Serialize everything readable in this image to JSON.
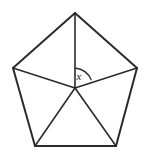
{
  "figure": {
    "kind": "regular-pentagon-with-center-spokes",
    "background_color": "#ffffff",
    "stroke_color": "#2b2b2b",
    "edge_stroke_width": 2,
    "spoke_stroke_width": 1.6,
    "arc_stroke_width": 1.3,
    "canvas": {
      "width": 149,
      "height": 156
    },
    "center": {
      "x": 75,
      "y": 88
    },
    "vertices": [
      {
        "name": "apex",
        "x": 75,
        "y": 13
      },
      {
        "name": "upper-right",
        "x": 137,
        "y": 68
      },
      {
        "name": "lower-right",
        "x": 116,
        "y": 146
      },
      {
        "name": "lower-left",
        "x": 35,
        "y": 146
      },
      {
        "name": "upper-left",
        "x": 13,
        "y": 68
      }
    ],
    "edges": [
      {
        "name": "edge-apex-to-upper-right",
        "from": "apex",
        "to": "upper-right"
      },
      {
        "name": "edge-upper-right-to-lower-right",
        "from": "upper-right",
        "to": "lower-right"
      },
      {
        "name": "edge-lower-right-to-lower-left",
        "from": "lower-right",
        "to": "lower-left"
      },
      {
        "name": "edge-lower-left-to-upper-left",
        "from": "lower-left",
        "to": "upper-left"
      },
      {
        "name": "edge-upper-left-to-apex",
        "from": "upper-left",
        "to": "apex"
      }
    ],
    "spokes": [
      {
        "name": "spoke-center-to-apex",
        "to": "apex"
      },
      {
        "name": "spoke-center-to-upper-right",
        "to": "upper-right"
      },
      {
        "name": "spoke-center-to-lower-right",
        "to": "lower-right"
      },
      {
        "name": "spoke-center-to-lower-left",
        "to": "lower-left"
      },
      {
        "name": "spoke-center-to-upper-left",
        "to": "upper-left"
      }
    ],
    "angle_arc": {
      "name": "central-angle-arc",
      "between_spokes": [
        "spoke-center-to-apex",
        "spoke-center-to-upper-right"
      ],
      "radius": 20,
      "path": "M 75 68 A 20 20 0 0 1 91.2 79.7",
      "label": "x",
      "label_position": {
        "x": 79,
        "y": 77
      }
    }
  }
}
